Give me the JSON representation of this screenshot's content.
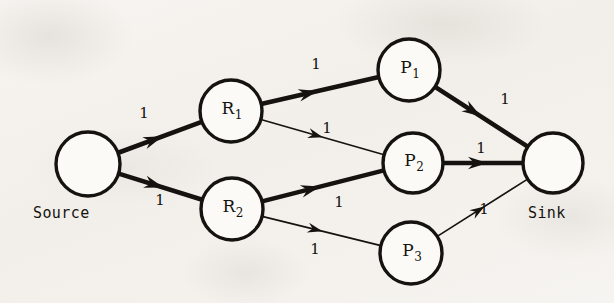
{
  "figure": {
    "type": "network-flow-diagram",
    "width": 614,
    "height": 303,
    "background_color": "#f4f2ee",
    "ink_color": "#15130f"
  },
  "nodes": [
    {
      "id": "source",
      "label": "",
      "sub": "",
      "cx": 88,
      "cy": 164,
      "r": 32,
      "outside_label": "Source",
      "outside_label_x": 33,
      "outside_label_y": 204
    },
    {
      "id": "r1",
      "label": "R",
      "sub": "1",
      "cx": 231,
      "cy": 111,
      "r": 31,
      "outside_label": "",
      "outside_label_x": 0,
      "outside_label_y": 0
    },
    {
      "id": "r2",
      "label": "R",
      "sub": "2",
      "cx": 232,
      "cy": 209,
      "r": 31,
      "outside_label": "",
      "outside_label_x": 0,
      "outside_label_y": 0
    },
    {
      "id": "p1",
      "label": "P",
      "sub": "1",
      "cx": 409,
      "cy": 70,
      "r": 31,
      "outside_label": "",
      "outside_label_x": 0,
      "outside_label_y": 0
    },
    {
      "id": "p2",
      "label": "P",
      "sub": "2",
      "cx": 413,
      "cy": 163,
      "r": 30,
      "outside_label": "",
      "outside_label_x": 0,
      "outside_label_y": 0
    },
    {
      "id": "p3",
      "label": "P",
      "sub": "3",
      "cx": 411,
      "cy": 253,
      "r": 31,
      "outside_label": "",
      "outside_label_x": 0,
      "outside_label_y": 0
    },
    {
      "id": "sink",
      "label": "",
      "sub": "",
      "cx": 553,
      "cy": 163,
      "r": 30,
      "outside_label": "Sink",
      "outside_label_x": 528,
      "outside_label_y": 204
    }
  ],
  "edges": [
    {
      "id": "source-r1",
      "from": "source",
      "to": "r1",
      "capacity": "1",
      "weight": "thick",
      "label_x": 144,
      "label_y": 113
    },
    {
      "id": "source-r2",
      "from": "source",
      "to": "r2",
      "capacity": "1",
      "weight": "thick",
      "label_x": 160,
      "label_y": 200
    },
    {
      "id": "r1-p1",
      "from": "r1",
      "to": "p1",
      "capacity": "1",
      "weight": "thick",
      "label_x": 316,
      "label_y": 64
    },
    {
      "id": "r1-p2",
      "from": "r1",
      "to": "p2",
      "capacity": "1",
      "weight": "thin",
      "label_x": 327,
      "label_y": 128
    },
    {
      "id": "r2-p2",
      "from": "r2",
      "to": "p2",
      "capacity": "1",
      "weight": "thick",
      "label_x": 339,
      "label_y": 202
    },
    {
      "id": "r2-p3",
      "from": "r2",
      "to": "p3",
      "capacity": "1",
      "weight": "thin",
      "label_x": 315,
      "label_y": 249
    },
    {
      "id": "p1-sink",
      "from": "p1",
      "to": "sink",
      "capacity": "1",
      "weight": "thick",
      "label_x": 505,
      "label_y": 99
    },
    {
      "id": "p2-sink",
      "from": "p2",
      "to": "sink",
      "capacity": "1",
      "weight": "thick",
      "label_x": 481,
      "label_y": 148
    },
    {
      "id": "p3-sink",
      "from": "p3",
      "to": "sink",
      "capacity": "1",
      "weight": "thin",
      "label_x": 484,
      "label_y": 209
    }
  ],
  "chart_data": {
    "type": "diagram",
    "title": "",
    "nodes": [
      "Source",
      "R1",
      "R2",
      "P1",
      "P2",
      "P3",
      "Sink"
    ],
    "edges": [
      {
        "source": "Source",
        "target": "R1",
        "capacity": 1,
        "highlighted": true
      },
      {
        "source": "Source",
        "target": "R2",
        "capacity": 1,
        "highlighted": true
      },
      {
        "source": "R1",
        "target": "P1",
        "capacity": 1,
        "highlighted": true
      },
      {
        "source": "R1",
        "target": "P2",
        "capacity": 1,
        "highlighted": false
      },
      {
        "source": "R2",
        "target": "P2",
        "capacity": 1,
        "highlighted": true
      },
      {
        "source": "R2",
        "target": "P3",
        "capacity": 1,
        "highlighted": false
      },
      {
        "source": "P1",
        "target": "Sink",
        "capacity": 1,
        "highlighted": true
      },
      {
        "source": "P2",
        "target": "Sink",
        "capacity": 1,
        "highlighted": true
      },
      {
        "source": "P3",
        "target": "Sink",
        "capacity": 1,
        "highlighted": false
      }
    ]
  }
}
